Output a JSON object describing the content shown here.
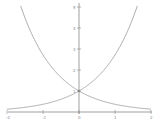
{
  "chart_data": {
    "type": "line",
    "title": "",
    "xlabel": "",
    "ylabel": "",
    "xlim": [
      -2,
      2
    ],
    "ylim": [
      0,
      5
    ],
    "grid": false,
    "x_ticks": [
      "-2",
      "-1",
      "0",
      "1",
      "2"
    ],
    "y_ticks": [
      "1",
      "2",
      "3",
      "4",
      "5"
    ],
    "series": [
      {
        "name": "e^x",
        "x": [
          -2,
          -1,
          0,
          1,
          1.609
        ],
        "y": [
          0.135,
          0.368,
          1,
          2.718,
          5
        ],
        "color": "#999999"
      },
      {
        "name": "e^-x",
        "x": [
          -1.609,
          -1,
          0,
          1,
          2
        ],
        "y": [
          5,
          2.718,
          1,
          0.368,
          0.135
        ],
        "color": "#999999"
      }
    ],
    "annotations": [
      "intersection at (0, 1)"
    ]
  },
  "colors": {
    "axis": "#888888",
    "curve": "#999999"
  }
}
